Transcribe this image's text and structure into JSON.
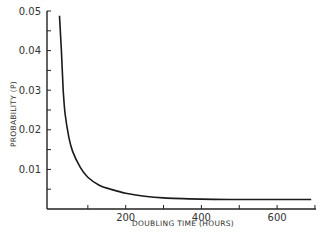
{
  "chart_data": {
    "type": "line",
    "title": "",
    "xlabel": "DOUBLING TIME (HOURS)",
    "ylabel": "PROBABILITY (P)",
    "xlim": [
      0,
      700
    ],
    "ylim": [
      0,
      0.05
    ],
    "grid": false,
    "legend": null,
    "x_ticks": [
      100,
      200,
      300,
      400,
      500,
      600,
      700
    ],
    "x_tick_labels": [
      {
        "value": 200,
        "label": "200"
      },
      {
        "value": 400,
        "label": "400"
      },
      {
        "value": 600,
        "label": "600"
      }
    ],
    "y_ticks": [
      0.005,
      0.01,
      0.015,
      0.02,
      0.025,
      0.03,
      0.035,
      0.04,
      0.045,
      0.05
    ],
    "y_tick_labels": [
      {
        "value": 0.01,
        "label": "0.01"
      },
      {
        "value": 0.02,
        "label": "0.02"
      },
      {
        "value": 0.03,
        "label": "0.03"
      },
      {
        "value": 0.04,
        "label": "0.04"
      },
      {
        "value": 0.05,
        "label": "0.05"
      }
    ],
    "series": [
      {
        "name": "P",
        "x": [
          25,
          30,
          35,
          40,
          50,
          60,
          80,
          100,
          130,
          160,
          200,
          250,
          300,
          400,
          500,
          600,
          690
        ],
        "y": [
          0.0488,
          0.04,
          0.03,
          0.024,
          0.018,
          0.0145,
          0.0105,
          0.008,
          0.006,
          0.005,
          0.004,
          0.0032,
          0.0028,
          0.0025,
          0.0024,
          0.0024,
          0.0024
        ]
      }
    ]
  }
}
